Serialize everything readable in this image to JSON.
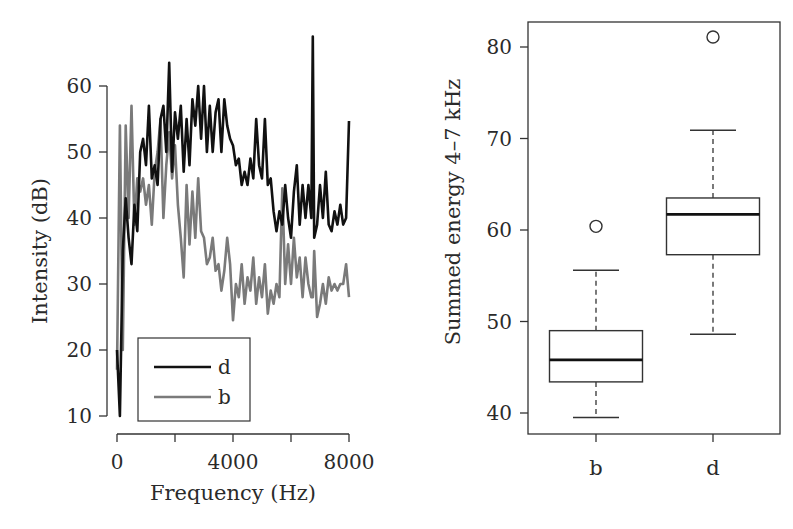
{
  "chart_data": [
    {
      "type": "line",
      "title": "",
      "xlabel": "Frequency (Hz)",
      "ylabel": "Intensity (dB)",
      "xlim": [
        0,
        8000
      ],
      "ylim": [
        10,
        60
      ],
      "xticks": [
        0,
        2000,
        4000,
        6000,
        8000
      ],
      "xtick_labels": [
        "0",
        "",
        "4000",
        "",
        "8000"
      ],
      "yticks": [
        10,
        20,
        30,
        40,
        50,
        60
      ],
      "ytick_labels": [
        "10",
        "20",
        "30",
        "40",
        "50",
        "60"
      ],
      "grid": false,
      "legend_position": "lower-left",
      "x": [
        0,
        100,
        200,
        300,
        400,
        500,
        600,
        700,
        800,
        900,
        1000,
        1100,
        1200,
        1300,
        1400,
        1500,
        1600,
        1700,
        1800,
        1900,
        2000,
        2100,
        2200,
        2300,
        2400,
        2500,
        2600,
        2700,
        2800,
        2900,
        3000,
        3100,
        3200,
        3300,
        3400,
        3500,
        3600,
        3700,
        3800,
        3900,
        4000,
        4100,
        4200,
        4300,
        4400,
        4500,
        4600,
        4700,
        4800,
        4900,
        5000,
        5100,
        5200,
        5300,
        5400,
        5500,
        5600,
        5700,
        5800,
        5900,
        6000,
        6100,
        6200,
        6300,
        6400,
        6500,
        6600,
        6700,
        6750,
        6800,
        6900,
        7000,
        7100,
        7200,
        7300,
        7400,
        7500,
        7600,
        7700,
        7800,
        7900,
        8000
      ],
      "series": [
        {
          "name": "d",
          "color": "#111111",
          "values": [
            20,
            10,
            35,
            43,
            37,
            33,
            42,
            38,
            50,
            52,
            48,
            57,
            46,
            48,
            45,
            55,
            57,
            50,
            63.5,
            47,
            56,
            52,
            57,
            47,
            55,
            48,
            58,
            54,
            60,
            52,
            60,
            50,
            57,
            50,
            56,
            58,
            50,
            58,
            54,
            52,
            51,
            48,
            49,
            45,
            47,
            45,
            49,
            46,
            55,
            48,
            46,
            55,
            45,
            46,
            41,
            38,
            41,
            39,
            45,
            40,
            37,
            44,
            48,
            39,
            45,
            40,
            45,
            40,
            67.5,
            37,
            39,
            45,
            40,
            47,
            39,
            38,
            41,
            39,
            42,
            39,
            40,
            54.7
          ]
        },
        {
          "name": "b",
          "color": "#7a7a7a",
          "values": [
            17,
            54,
            20,
            54,
            40,
            57,
            39,
            46,
            44,
            46,
            42,
            45,
            39,
            47,
            50,
            55,
            40,
            48,
            53,
            46,
            51,
            42,
            37,
            31,
            45,
            36,
            44,
            37,
            46,
            38,
            37,
            33,
            34,
            37,
            32,
            33,
            29,
            32,
            37,
            33,
            24.5,
            30,
            28,
            33,
            27,
            31,
            29,
            34,
            27,
            31,
            28,
            33,
            25.5,
            29,
            27,
            30,
            28,
            44.5,
            30,
            36,
            30,
            37,
            31,
            34,
            28,
            34,
            30,
            28,
            28,
            35,
            25,
            27,
            30,
            27,
            31,
            29,
            30,
            29,
            30,
            30,
            33,
            28
          ]
        }
      ],
      "legend": [
        "d",
        "b"
      ]
    },
    {
      "type": "box",
      "title": "",
      "xlabel": "",
      "ylabel": "Summed energy 4–7 kHz",
      "ylim": [
        38,
        83
      ],
      "yticks": [
        40,
        50,
        60,
        70,
        80
      ],
      "ytick_labels": [
        "40",
        "50",
        "60",
        "70",
        "80"
      ],
      "categories": [
        "b",
        "d"
      ],
      "grid": false,
      "boxes": [
        {
          "name": "b",
          "whisker_low": 39.5,
          "q1": 43.4,
          "median": 45.8,
          "q3": 49.0,
          "whisker_high": 55.6,
          "outliers": [
            60.4
          ]
        },
        {
          "name": "d",
          "whisker_low": 48.6,
          "q1": 57.3,
          "median": 61.7,
          "q3": 63.5,
          "whisker_high": 70.9,
          "outliers": [
            81.1
          ]
        }
      ]
    }
  ]
}
